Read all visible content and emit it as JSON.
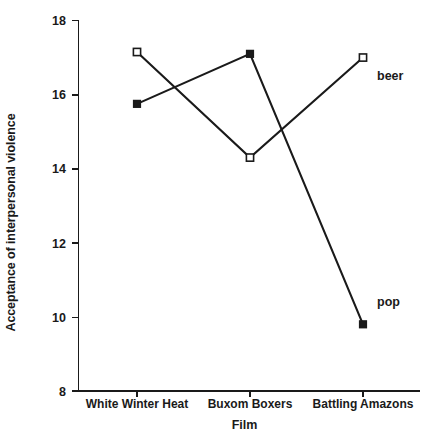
{
  "chart_data": {
    "type": "line",
    "title": "",
    "xlabel": "Film",
    "ylabel": "Acceptance of interpersonal violence",
    "categories": [
      "White Winter Heat",
      "Buxom Boxers",
      "Battling Amazons"
    ],
    "ylim": [
      8,
      18
    ],
    "yticks": [
      8,
      10,
      12,
      14,
      16,
      18
    ],
    "ytick_labels": [
      "8",
      "10",
      "12",
      "14",
      "16",
      "18"
    ],
    "grid": false,
    "legend_position": "inline-right-end-of-line",
    "series": [
      {
        "name": "beer",
        "marker": "open-square",
        "color": "#1a1a1a",
        "values": [
          17.15,
          14.3,
          17.0
        ]
      },
      {
        "name": "pop",
        "marker": "filled-square",
        "color": "#1a1a1a",
        "values": [
          15.75,
          17.1,
          9.8
        ]
      }
    ]
  },
  "labels": {
    "y_axis_title": "Acceptance of interpersonal violence",
    "x_axis_title": "Film",
    "series_beer": "beer",
    "series_pop": "pop",
    "cat_1": "White Winter Heat",
    "cat_2": "Buxom Boxers",
    "cat_3": "Battling Amazons",
    "ytick_18": "18",
    "ytick_16": "16",
    "ytick_14": "14",
    "ytick_12": "12",
    "ytick_10": "10",
    "ytick_8": "8"
  }
}
